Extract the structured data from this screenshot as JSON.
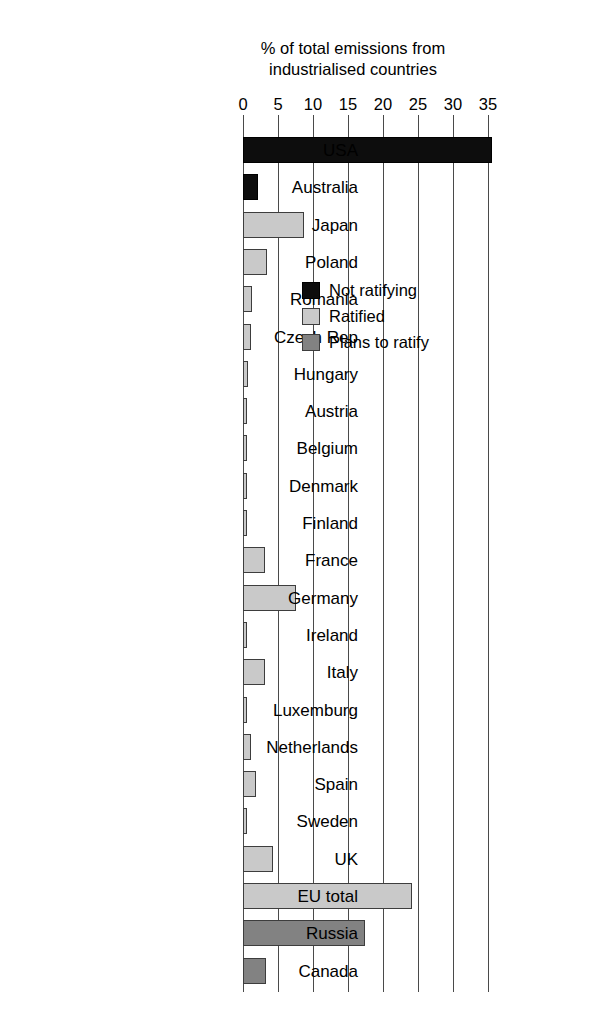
{
  "chart_data": {
    "type": "bar",
    "orientation": "horizontal",
    "title": "% of total emissions from industrialised countries",
    "title_lines": [
      "% of total emissions from",
      "industrialised countries"
    ],
    "xlabel": "",
    "ylabel": "",
    "xlim": [
      0,
      35
    ],
    "xticks": [
      0,
      5,
      10,
      15,
      20,
      25,
      30,
      35
    ],
    "xtick_labels": [
      "0",
      "5",
      "10",
      "15",
      "20",
      "25",
      "30",
      "35"
    ],
    "grid": "vertical",
    "legend_position": "upper-center-inside",
    "categories": [
      "USA",
      "Australia",
      "Japan",
      "Poland",
      "Romania",
      "Czech Rep",
      "Hungary",
      "Austria",
      "Belgium",
      "Denmark",
      "Finland",
      "France",
      "Germany",
      "Ireland",
      "Italy",
      "Luxemburg",
      "Netherlands",
      "Spain",
      "Sweden",
      "UK",
      "EU total",
      "Russia",
      "Canada"
    ],
    "values": [
      35.5,
      2.1,
      8.7,
      3.4,
      1.3,
      1.2,
      0.7,
      0.5,
      0.6,
      0.5,
      0.5,
      3.1,
      7.6,
      0.4,
      3.1,
      0.3,
      1.2,
      1.9,
      0.4,
      4.3,
      24.2,
      17.4,
      3.3
    ],
    "groups": [
      "not_ratifying",
      "not_ratifying",
      "ratified",
      "ratified",
      "ratified",
      "ratified",
      "ratified",
      "ratified",
      "ratified",
      "ratified",
      "ratified",
      "ratified",
      "ratified",
      "ratified",
      "ratified",
      "ratified",
      "ratified",
      "ratified",
      "ratified",
      "ratified",
      "ratified",
      "plans_to_ratify",
      "plans_to_ratify"
    ],
    "legend": [
      {
        "key": "not_ratifying",
        "label": "Not ratifying",
        "color": "#0d0d0d"
      },
      {
        "key": "ratified",
        "label": "Ratified",
        "color": "#c9c9c9"
      },
      {
        "key": "plans_to_ratify",
        "label": "Plans to ratify",
        "color": "#828282"
      }
    ]
  }
}
